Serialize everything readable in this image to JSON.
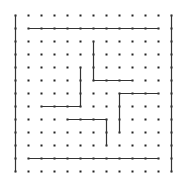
{
  "maze": {
    "grid": {
      "cols": 13,
      "rows": 13,
      "origin_x": 15.5,
      "origin_y": 15.5,
      "spacing": 13
    },
    "colors": {
      "background": "#ffffff",
      "dot": "#222222",
      "wall": "#333333"
    },
    "walls": [
      {
        "name": "left-border",
        "from": [
          0,
          0
        ],
        "to": [
          0,
          12
        ]
      },
      {
        "name": "right-border",
        "from": [
          12,
          0
        ],
        "to": [
          12,
          12
        ]
      },
      {
        "name": "top-inner-wall",
        "from": [
          1,
          1
        ],
        "to": [
          11,
          1
        ]
      },
      {
        "name": "wall-a-vertical",
        "from": [
          6,
          2
        ],
        "to": [
          6,
          5
        ]
      },
      {
        "name": "wall-a-horizontal",
        "from": [
          6,
          5
        ],
        "to": [
          9,
          5
        ]
      },
      {
        "name": "wall-b-vertical",
        "from": [
          5,
          4
        ],
        "to": [
          5,
          7
        ]
      },
      {
        "name": "wall-b-horizontal",
        "from": [
          2,
          7
        ],
        "to": [
          5,
          7
        ]
      },
      {
        "name": "wall-c-horizontal",
        "from": [
          8,
          6
        ],
        "to": [
          11,
          6
        ]
      },
      {
        "name": "wall-c-vertical",
        "from": [
          8,
          6
        ],
        "to": [
          8,
          9
        ]
      },
      {
        "name": "wall-d-horizontal",
        "from": [
          4,
          8
        ],
        "to": [
          7,
          8
        ]
      },
      {
        "name": "wall-d-vertical",
        "from": [
          7,
          8
        ],
        "to": [
          7,
          10
        ]
      },
      {
        "name": "bottom-inner-wall",
        "from": [
          1,
          11
        ],
        "to": [
          11,
          11
        ]
      }
    ]
  }
}
